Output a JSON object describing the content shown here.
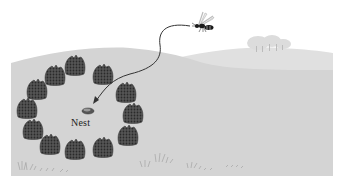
{
  "figure": {
    "nest_label": "Nest",
    "colors": {
      "background": "#ffffff",
      "far_hill": "#e2e2e2",
      "near_hill": "#cfcfcf",
      "ground": "#d6d6d6",
      "pinecone": "#4a4a4a",
      "pinecone_texture": "#2a2a2a",
      "flight_path": "#333333",
      "wasp": "#1a1a1a",
      "trees": "#d9d9d9",
      "grass": "#9a9a9a"
    },
    "pinecones": [
      {
        "x": 75,
        "y": 66
      },
      {
        "x": 55,
        "y": 76
      },
      {
        "x": 37,
        "y": 90
      },
      {
        "x": 27,
        "y": 109
      },
      {
        "x": 33,
        "y": 130
      },
      {
        "x": 50,
        "y": 145
      },
      {
        "x": 75,
        "y": 150
      },
      {
        "x": 103,
        "y": 148
      },
      {
        "x": 128,
        "y": 136
      },
      {
        "x": 133,
        "y": 114
      },
      {
        "x": 126,
        "y": 93
      },
      {
        "x": 103,
        "y": 75
      }
    ],
    "nest": {
      "x": 87,
      "y": 110
    },
    "wasp": {
      "x": 201,
      "y": 25
    }
  }
}
